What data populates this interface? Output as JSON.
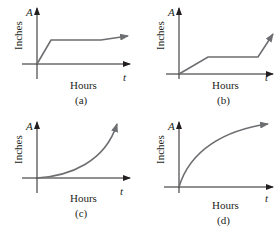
{
  "figure": {
    "panels": [
      {
        "id": "a",
        "caption": "(a)",
        "y_axis_var": "A",
        "y_axis_label": "Inches",
        "x_axis_var": "t",
        "x_axis_label": "Hours",
        "shape": "rapid linear rise, then plateau, then slight rise"
      },
      {
        "id": "b",
        "caption": "(b)",
        "y_axis_var": "A",
        "y_axis_label": "Inches",
        "x_axis_var": "t",
        "x_axis_label": "Hours",
        "shape": "slow linear rise, long plateau, then steep rise"
      },
      {
        "id": "c",
        "caption": "(c)",
        "y_axis_var": "A",
        "y_axis_label": "Inches",
        "x_axis_var": "t",
        "x_axis_label": "Hours",
        "shape": "increasing concave-up curve"
      },
      {
        "id": "d",
        "caption": "(d)",
        "y_axis_var": "A",
        "y_axis_label": "Inches",
        "x_axis_var": "t",
        "x_axis_label": "Hours",
        "shape": "increasing concave-down curve"
      }
    ]
  },
  "colors": {
    "axis": "#231f20",
    "curve": "#6d6e71"
  }
}
